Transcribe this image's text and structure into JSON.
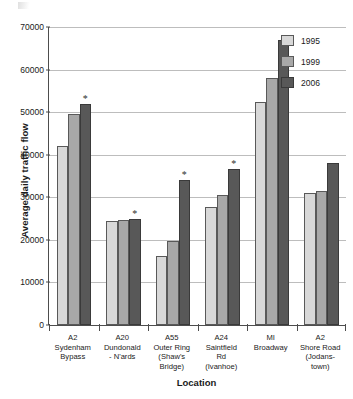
{
  "chart_data": {
    "type": "bar",
    "title": "",
    "xlabel": "Location",
    "ylabel": "Average daily traffic flow",
    "ylim": [
      0,
      70000
    ],
    "yticks": [
      0,
      10000,
      20000,
      30000,
      40000,
      50000,
      60000,
      70000
    ],
    "ytick_labels": [
      "0",
      "10000",
      "20000",
      "30000",
      "40000",
      "50000",
      "60000",
      "70000"
    ],
    "grid": true,
    "legend_position": "top-right",
    "categories": [
      "A2 Sydenham Bypass",
      "A20 Dundonald - N'ards",
      "A55 Outer Ring (Shaw's Bridge)",
      "A24 Saintfield Rd (Ivanhoe)",
      "MI Broadway",
      "A2 Shore Road (Jodanstown)"
    ],
    "category_lines": [
      [
        "A2",
        "Sydenham",
        "Bypass"
      ],
      [
        "A20",
        "Dundonald",
        "- N'ards"
      ],
      [
        "A55",
        "Outer Ring",
        "(Shaw's",
        "Bridge)"
      ],
      [
        "A24",
        "Saintfield",
        "Rd",
        "(Ivanhoe)"
      ],
      [
        "MI",
        "Broadway"
      ],
      [
        "A2",
        "Shore Road",
        "(Jodans-",
        "town)"
      ]
    ],
    "series": [
      {
        "name": "1995",
        "color": "#d8d8d8",
        "values": [
          42000,
          24500,
          16100,
          27800,
          52500,
          31000
        ]
      },
      {
        "name": "1999",
        "color": "#a8a8a8",
        "values": [
          49500,
          24600,
          19800,
          30500,
          58000,
          31500
        ]
      },
      {
        "name": "2006",
        "color": "#585858",
        "values": [
          52000,
          25000,
          34000,
          36700,
          67000,
          38000
        ]
      }
    ],
    "annotations": {
      "symbol": "*",
      "note": "asterisk marks significant 2006 values",
      "marked_series": "2006",
      "marked_categories": [
        0,
        1,
        2,
        3
      ]
    }
  },
  "legend": {
    "items": [
      {
        "label": "1995",
        "swatch": "s0"
      },
      {
        "label": "1999",
        "swatch": "s1"
      },
      {
        "label": "2006",
        "swatch": "s2"
      }
    ]
  }
}
